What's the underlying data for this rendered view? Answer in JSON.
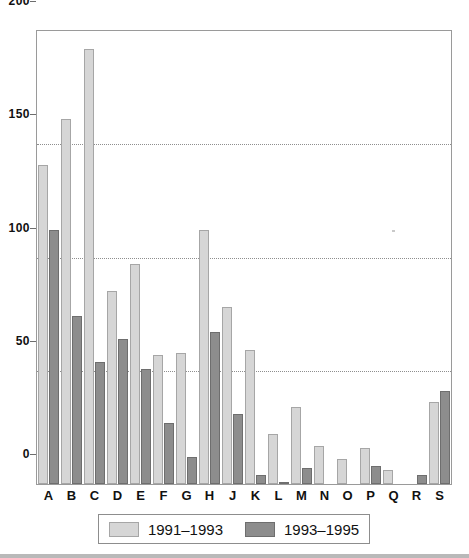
{
  "chart_data": {
    "type": "bar",
    "title": "",
    "subtitle": "",
    "xlabel": "",
    "ylabel": "",
    "ylim": [
      0,
      200
    ],
    "yticks": [
      0,
      50,
      100,
      150,
      200
    ],
    "ytick_labels": [
      "0",
      "50",
      "100",
      "150",
      "200"
    ],
    "grid": true,
    "grid_axis": "y",
    "legend_position": "bottom",
    "categories": [
      "A",
      "B",
      "C",
      "D",
      "E",
      "F",
      "G",
      "H",
      "J",
      "K",
      "L",
      "M",
      "N",
      "O",
      "P",
      "Q",
      "R",
      "S"
    ],
    "series": [
      {
        "name": "1991–1993",
        "color": "#d6d6d6",
        "values": [
          141,
          161,
          192,
          85,
          97,
          57,
          58,
          112,
          78,
          59,
          22,
          34,
          17,
          11,
          16,
          6,
          0,
          36
        ]
      },
      {
        "name": "1993–1995",
        "color": "#8d8d8d",
        "values": [
          112,
          74,
          54,
          64,
          51,
          27,
          12,
          67,
          31,
          4,
          1,
          7,
          0,
          0,
          8,
          0,
          4,
          41
        ]
      }
    ]
  },
  "axes": {
    "y_ticks": [
      "200",
      "150",
      "100",
      "50",
      "0"
    ],
    "x_ticks": [
      "A",
      "B",
      "C",
      "D",
      "E",
      "F",
      "G",
      "H",
      "J",
      "K",
      "L",
      "M",
      "N",
      "O",
      "P",
      "Q",
      "R",
      "S"
    ]
  },
  "legend": {
    "items": [
      {
        "label": "1991–1993",
        "swatch": "light-gray-swatch"
      },
      {
        "label": "1993–1995",
        "swatch": "dark-gray-swatch"
      }
    ]
  }
}
